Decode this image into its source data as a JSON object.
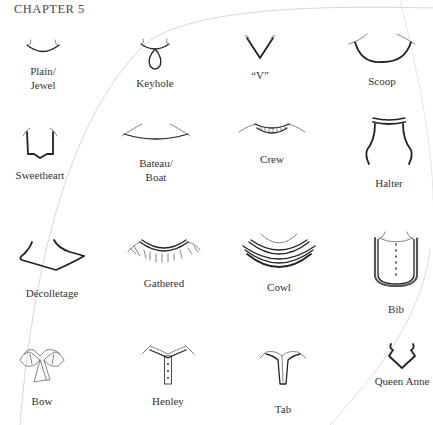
{
  "page": {
    "header": "CHAPTER 5"
  },
  "necklines": [
    {
      "id": "plain-jewel",
      "label": "Plain/\nJewel",
      "icon": "plain-jewel-neckline-icon"
    },
    {
      "id": "keyhole",
      "label": "Keyhole",
      "icon": "keyhole-neckline-icon"
    },
    {
      "id": "v",
      "label": "“V”",
      "icon": "v-neckline-icon"
    },
    {
      "id": "scoop",
      "label": "Scoop",
      "icon": "scoop-neckline-icon"
    },
    {
      "id": "sweetheart",
      "label": "Sweetheart",
      "icon": "sweetheart-neckline-icon"
    },
    {
      "id": "bateau-boat",
      "label": "Bateau/\nBoat",
      "icon": "bateau-neckline-icon"
    },
    {
      "id": "crew",
      "label": "Crew",
      "icon": "crew-neckline-icon"
    },
    {
      "id": "halter",
      "label": "Halter",
      "icon": "halter-neckline-icon"
    },
    {
      "id": "decolletage",
      "label": "Décolletage",
      "icon": "decolletage-neckline-icon"
    },
    {
      "id": "gathered",
      "label": "Gathered",
      "icon": "gathered-neckline-icon"
    },
    {
      "id": "cowl",
      "label": "Cowl",
      "icon": "cowl-neckline-icon"
    },
    {
      "id": "bib",
      "label": "Bib",
      "icon": "bib-neckline-icon"
    },
    {
      "id": "bow",
      "label": "Bow",
      "icon": "bow-neckline-icon"
    },
    {
      "id": "henley",
      "label": "Henley",
      "icon": "henley-neckline-icon"
    },
    {
      "id": "tab",
      "label": "Tab",
      "icon": "tab-neckline-icon"
    },
    {
      "id": "queen-anne",
      "label": "Queen Anne",
      "icon": "queen-anne-neckline-icon"
    }
  ]
}
